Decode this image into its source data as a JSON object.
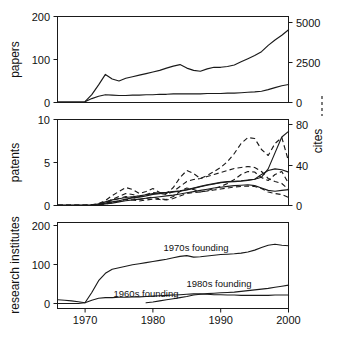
{
  "figure": {
    "background": "#ffffff",
    "ink": "#1a1a1a",
    "legend_note": "dashed lines indicate cites (right-hand axis)"
  },
  "chart_data": [
    {
      "id": "panel-papers",
      "type": "line",
      "title": "",
      "xlabel": "",
      "ylabel": "papers",
      "y2label": "cites",
      "xlim": [
        1966,
        2000
      ],
      "ylim": [
        0,
        220
      ],
      "y2lim": [
        0,
        5500
      ],
      "xticks": [
        1970,
        1980,
        1990,
        2000
      ],
      "xticklabels": [
        "1970",
        "1980",
        "1990",
        "2000"
      ],
      "yticks": [
        0,
        100,
        200
      ],
      "yticklabels": [
        "0",
        "100",
        "200"
      ],
      "y2ticks": [
        0,
        2500,
        5000
      ],
      "y2ticklabels": [
        "0",
        "2500",
        "5000"
      ],
      "grid": false,
      "legend_position": "none",
      "x": [
        1966,
        1967,
        1968,
        1969,
        1970,
        1971,
        1972,
        1973,
        1974,
        1975,
        1976,
        1977,
        1978,
        1979,
        1980,
        1981,
        1982,
        1983,
        1984,
        1985,
        1986,
        1987,
        1988,
        1989,
        1990,
        1991,
        1992,
        1993,
        1994,
        1995,
        1996,
        1997,
        1998,
        1999,
        2000
      ],
      "series": [
        {
          "name": "papers-upper",
          "style": "solid",
          "axis": "left",
          "values": [
            1,
            1,
            1,
            1,
            2,
            20,
            45,
            72,
            60,
            55,
            62,
            66,
            70,
            74,
            78,
            82,
            88,
            93,
            97,
            88,
            82,
            80,
            86,
            90,
            90,
            92,
            96,
            104,
            112,
            120,
            130,
            146,
            160,
            172,
            186
          ]
        },
        {
          "name": "cites-upper",
          "style": "dashed",
          "axis": "right",
          "values": [
            20,
            20,
            22,
            22,
            40,
            300,
            700,
            1000,
            900,
            780,
            760,
            820,
            900,
            960,
            1040,
            1120,
            1220,
            1300,
            1380,
            1300,
            1260,
            1250,
            1320,
            1400,
            1440,
            1500,
            1580,
            1700,
            1880,
            2060,
            2300,
            2700,
            3200,
            3700,
            4400
          ]
        },
        {
          "name": "papers-lower",
          "style": "solid",
          "axis": "left",
          "values": [
            1,
            1,
            1,
            1,
            2,
            10,
            16,
            20,
            19,
            18,
            18,
            19,
            19,
            20,
            20,
            21,
            21,
            22,
            22,
            22,
            22,
            22,
            23,
            23,
            23,
            24,
            24,
            25,
            26,
            27,
            29,
            33,
            38,
            43,
            46
          ]
        },
        {
          "name": "cites-lower",
          "style": "dashed",
          "axis": "right",
          "values": [
            20,
            20,
            20,
            20,
            30,
            120,
            220,
            300,
            300,
            300,
            310,
            320,
            330,
            340,
            350,
            370,
            380,
            400,
            410,
            420,
            420,
            430,
            440,
            450,
            460,
            470,
            490,
            520,
            560,
            610,
            670,
            760,
            870,
            950,
            980
          ]
        }
      ]
    },
    {
      "id": "panel-patents",
      "type": "line",
      "title": "",
      "xlabel": "",
      "ylabel": "patents",
      "y2label": "cites",
      "xlim": [
        1966,
        2000
      ],
      "ylim": [
        0,
        10.8
      ],
      "y2lim": [
        0,
        86
      ],
      "xticks": [
        1970,
        1980,
        1990,
        2000
      ],
      "xticklabels": [
        "1970",
        "1980",
        "1990",
        "2000"
      ],
      "yticks": [
        0,
        5,
        10
      ],
      "yticklabels": [
        "0",
        "5",
        "10"
      ],
      "y2ticks": [
        0,
        40,
        80
      ],
      "y2ticklabels": [
        "0",
        "40",
        "80"
      ],
      "grid": false,
      "legend_position": "none",
      "x": [
        1966,
        1967,
        1968,
        1969,
        1970,
        1971,
        1972,
        1973,
        1974,
        1975,
        1976,
        1977,
        1978,
        1979,
        1980,
        1981,
        1982,
        1983,
        1984,
        1985,
        1986,
        1987,
        1988,
        1989,
        1990,
        1991,
        1992,
        1993,
        1994,
        1995,
        1996,
        1997,
        1998,
        1999,
        2000
      ],
      "series": [
        {
          "name": "patents-upper",
          "style": "solid",
          "axis": "left",
          "values": [
            0.02,
            0.02,
            0.02,
            0.02,
            0.03,
            0.05,
            0.2,
            0.45,
            0.7,
            0.85,
            1.0,
            1.1,
            1.2,
            1.35,
            1.5,
            1.6,
            1.65,
            1.75,
            1.85,
            2.0,
            2.2,
            2.4,
            2.6,
            2.75,
            2.9,
            3.0,
            3.05,
            3.1,
            3.2,
            3.3,
            3.55,
            4.6,
            6.6,
            8.6,
            9.3
          ]
        },
        {
          "name": "patents-lower",
          "style": "solid",
          "axis": "left",
          "values": [
            0.02,
            0.02,
            0.02,
            0.02,
            0.03,
            0.04,
            0.12,
            0.3,
            0.45,
            0.6,
            0.8,
            0.95,
            1.05,
            1.2,
            1.4,
            1.5,
            1.6,
            1.7,
            1.8,
            1.95,
            2.15,
            2.35,
            2.55,
            2.7,
            2.85,
            2.95,
            3.0,
            3.05,
            3.15,
            3.3,
            3.9,
            4.4,
            4.6,
            4.5,
            4.2
          ]
        },
        {
          "name": "cites-upper",
          "style": "dashed",
          "axis": "right",
          "values": [
            0.2,
            0.2,
            0.2,
            0.2,
            0.3,
            0.6,
            2,
            5,
            10,
            14,
            18,
            16,
            12,
            14,
            17,
            13,
            12,
            18,
            28,
            35,
            32,
            27,
            30,
            34,
            38,
            44,
            52,
            62,
            68,
            67,
            56,
            50,
            62,
            68,
            44
          ]
        },
        {
          "name": "cites-lower",
          "style": "dashed",
          "axis": "right",
          "values": [
            0.2,
            0.2,
            0.2,
            0.2,
            0.3,
            0.5,
            1.5,
            3,
            6,
            9,
            12,
            11,
            9,
            11,
            13,
            12,
            11,
            14,
            19,
            24,
            26,
            27,
            29,
            31,
            33,
            35,
            37,
            38,
            39,
            38,
            34,
            27,
            24,
            22,
            16
          ]
        },
        {
          "name": "patents-extra",
          "style": "solid",
          "axis": "left",
          "values": [
            0.02,
            0.02,
            0.02,
            0.02,
            0.03,
            0.03,
            0.08,
            0.2,
            0.3,
            0.45,
            0.6,
            0.7,
            0.8,
            0.9,
            1.0,
            1.1,
            1.2,
            1.3,
            1.45,
            1.6,
            1.75,
            1.9,
            2.05,
            2.2,
            2.3,
            2.4,
            2.5,
            2.55,
            2.6,
            2.5,
            2.2,
            1.9,
            1.8,
            1.9,
            2.0
          ]
        }
      ]
    },
    {
      "id": "panel-research-institutes",
      "type": "line",
      "title": "",
      "xlabel": "",
      "ylabel": "research institutes",
      "xlim": [
        1966,
        2000
      ],
      "ylim": [
        0,
        220
      ],
      "xticks": [
        1970,
        1980,
        1990,
        2000
      ],
      "xticklabels": [
        "1970",
        "1980",
        "1990",
        "2000"
      ],
      "yticks": [
        0,
        100,
        200
      ],
      "yticklabels": [
        "0",
        "100",
        "200"
      ],
      "grid": false,
      "legend_position": "inline-annotations",
      "annotations": [
        {
          "id": "annot-1970s",
          "text": "1970s founding",
          "x": 1982.0,
          "y": 148
        },
        {
          "id": "annot-1960s",
          "text": "1960s founding",
          "x": 1974.6,
          "y": 28
        },
        {
          "id": "annot-1980s",
          "text": "1980s founding",
          "x": 1988.0,
          "y": 62
        }
      ],
      "series": [
        {
          "name": "1970s founding",
          "style": "solid",
          "axis": "left",
          "x": [
            1966,
            1967,
            1968,
            1969,
            1970,
            1971,
            1972,
            1973,
            1974,
            1975,
            1976,
            1977,
            1978,
            1979,
            1980,
            1981,
            1982,
            1983,
            1984,
            1985,
            1986,
            1987,
            1988,
            1989,
            1990,
            1991,
            1992,
            1993,
            1994,
            1995,
            1996,
            1997,
            1998,
            1999,
            2000
          ],
          "values": [
            0,
            0,
            0,
            0,
            2,
            30,
            62,
            82,
            93,
            97,
            101,
            105,
            108,
            111,
            114,
            117,
            120,
            124,
            128,
            130,
            126,
            127,
            129,
            131,
            133,
            134,
            135,
            137,
            140,
            145,
            152,
            158,
            161,
            158,
            157
          ]
        },
        {
          "name": "1960s founding",
          "style": "solid",
          "axis": "left",
          "x": [
            1966,
            1967,
            1968,
            1969,
            1970,
            1971,
            1972,
            1973,
            1974,
            1975,
            1976,
            1977,
            1978,
            1979,
            1980,
            1981,
            1982,
            1983,
            1984,
            1985,
            1986,
            1987,
            1988,
            1989,
            1990,
            1991,
            1992,
            1993,
            1994,
            1995,
            1996,
            1997,
            1998,
            1999,
            2000
          ],
          "values": [
            10,
            9,
            7,
            5,
            2,
            9,
            14,
            16,
            16,
            17,
            17,
            18,
            18,
            19,
            20,
            21,
            22,
            23,
            24,
            25,
            26,
            26,
            25,
            24,
            24,
            23,
            23,
            22,
            22,
            22,
            22,
            22,
            23,
            23,
            23
          ]
        },
        {
          "name": "1980s founding",
          "style": "solid",
          "axis": "left",
          "x": [
            1979,
            1980,
            1981,
            1982,
            1983,
            1984,
            1985,
            1986,
            1987,
            1988,
            1989,
            1990,
            1991,
            1992,
            1993,
            1994,
            1995,
            1996,
            1997,
            1998,
            1999,
            2000
          ],
          "values": [
            2,
            4,
            7,
            10,
            13,
            16,
            19,
            23,
            25,
            27,
            28,
            29,
            30,
            31,
            33,
            35,
            37,
            39,
            41,
            44,
            47,
            50
          ]
        }
      ]
    }
  ]
}
